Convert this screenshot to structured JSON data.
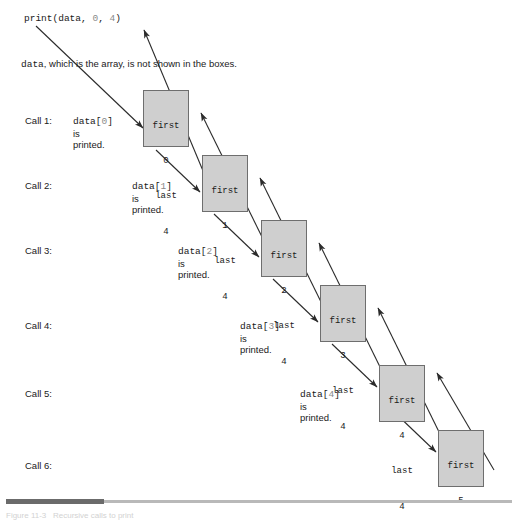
{
  "figure": {
    "header_call": {
      "prefix": "print(data, ",
      "arg1": "0",
      "mid": ", ",
      "arg2": "4",
      "suffix": ")"
    },
    "note": {
      "mono_word": "data",
      "rest": ", which is the array, is not shown in the boxes."
    },
    "calls": [
      {
        "label": "Call 1:",
        "printed_var": "data[",
        "printed_index": "0",
        "printed_close": "]",
        "printed_line2": "is",
        "printed_line3": "printed.",
        "box": {
          "first_label": "first",
          "first_value": "0",
          "last_label": "last",
          "last_value": "4"
        }
      },
      {
        "label": "Call 2:",
        "printed_var": "data[",
        "printed_index": "1",
        "printed_close": "]",
        "printed_line2": "is",
        "printed_line3": "printed.",
        "box": {
          "first_label": "first",
          "first_value": "1",
          "last_label": "last",
          "last_value": "4"
        }
      },
      {
        "label": "Call 3:",
        "printed_var": "data[",
        "printed_index": "2",
        "printed_close": "]",
        "printed_line2": "is",
        "printed_line3": "printed.",
        "box": {
          "first_label": "first",
          "first_value": "2",
          "last_label": "last",
          "last_value": "4"
        }
      },
      {
        "label": "Call 4:",
        "printed_var": "data[",
        "printed_index": "3",
        "printed_close": "]",
        "printed_line2": "is",
        "printed_line3": "printed.",
        "box": {
          "first_label": "first",
          "first_value": "3",
          "last_label": "last",
          "last_value": "4"
        }
      },
      {
        "label": "Call 5:",
        "printed_var": "data[",
        "printed_index": "4",
        "printed_close": "]",
        "printed_line2": "is",
        "printed_line3": "printed.",
        "box": {
          "first_label": "first",
          "first_value": "4",
          "last_label": "last",
          "last_value": "4"
        }
      },
      {
        "label": "Call 6:",
        "printed_var": "",
        "printed_index": "",
        "printed_close": "",
        "printed_line2": "",
        "printed_line3": "",
        "box": {
          "first_label": "first",
          "first_value": "5",
          "last_label": "last",
          "last_value": "4"
        }
      }
    ],
    "caption": "Figure 11-3   Recursive calls to print",
    "colors": {
      "box_fill": "#cfcfcf",
      "box_border": "#6e6e6e",
      "arrow": "#2b2b2b",
      "code_number": "#8a8a8a",
      "rule_light": "#b9b9b9",
      "rule_dark": "#6b6b6b"
    }
  }
}
